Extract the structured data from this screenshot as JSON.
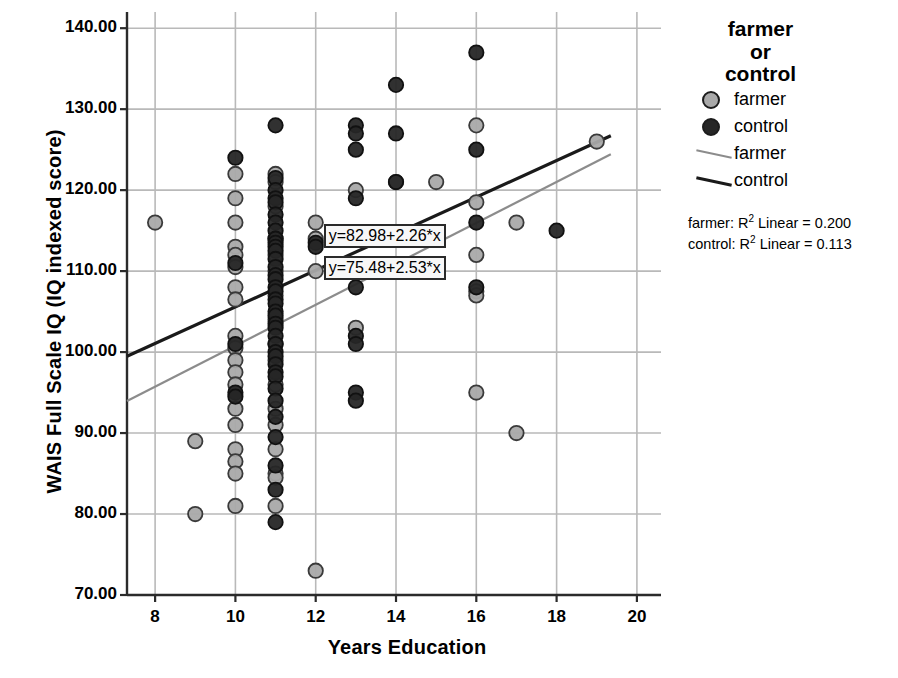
{
  "chart_data": {
    "type": "scatter",
    "title": "",
    "xlabel": "Years Education",
    "ylabel": "WAIS Full Scale IQ (IQ indexed score)",
    "xlim": [
      7.3,
      20.6
    ],
    "ylim": [
      70,
      142
    ],
    "xticks": [
      "8",
      "10",
      "12",
      "14",
      "16",
      "18",
      "20"
    ],
    "xtick_values": [
      8,
      10,
      12,
      14,
      16,
      18,
      20
    ],
    "yticks": [
      "70.00",
      "80.00",
      "90.00",
      "100.00",
      "110.00",
      "120.00",
      "130.00",
      "140.00"
    ],
    "ytick_values": [
      70,
      80,
      90,
      100,
      110,
      120,
      130,
      140
    ],
    "grid": true,
    "legend_position": "right",
    "series": [
      {
        "name": "farmer",
        "marker": "circle",
        "color": "#a9a9a9",
        "edge_color": "#3a3a3a",
        "points": [
          [
            8,
            116
          ],
          [
            9,
            89
          ],
          [
            9,
            80
          ],
          [
            10,
            122
          ],
          [
            10,
            119
          ],
          [
            10,
            116
          ],
          [
            10,
            113
          ],
          [
            10,
            112
          ],
          [
            10,
            110.5
          ],
          [
            10,
            108
          ],
          [
            10,
            106.5
          ],
          [
            10,
            102
          ],
          [
            10,
            100.5
          ],
          [
            10,
            99
          ],
          [
            10,
            97.5
          ],
          [
            10,
            96
          ],
          [
            10,
            93
          ],
          [
            10,
            91
          ],
          [
            10,
            88
          ],
          [
            10,
            86.5
          ],
          [
            10,
            85
          ],
          [
            10,
            81
          ],
          [
            11,
            122
          ],
          [
            11,
            121
          ],
          [
            11,
            118
          ],
          [
            11,
            114
          ],
          [
            11,
            112
          ],
          [
            11,
            110
          ],
          [
            11,
            107
          ],
          [
            11,
            104
          ],
          [
            11,
            101
          ],
          [
            11,
            99
          ],
          [
            11,
            96
          ],
          [
            11,
            93
          ],
          [
            11,
            91
          ],
          [
            11,
            88
          ],
          [
            11,
            85
          ],
          [
            11,
            84.5
          ],
          [
            11,
            81
          ],
          [
            12,
            116
          ],
          [
            12,
            114
          ],
          [
            12,
            110
          ],
          [
            12,
            73
          ],
          [
            13,
            120
          ],
          [
            13,
            103
          ],
          [
            14,
            121
          ],
          [
            15,
            121
          ],
          [
            16,
            128
          ],
          [
            16,
            118.5
          ],
          [
            16,
            112
          ],
          [
            16,
            107.5
          ],
          [
            16,
            107
          ],
          [
            16,
            95
          ],
          [
            17,
            116
          ],
          [
            17,
            90
          ],
          [
            19,
            126
          ]
        ]
      },
      {
        "name": "control",
        "marker": "circle",
        "color": "#262626",
        "edge_color": "#111111",
        "points": [
          [
            10,
            124
          ],
          [
            10,
            111
          ],
          [
            10,
            101
          ],
          [
            10,
            95
          ],
          [
            10,
            94.5
          ],
          [
            11,
            128
          ],
          [
            11,
            121.5
          ],
          [
            11,
            120
          ],
          [
            11,
            119
          ],
          [
            11,
            118.5
          ],
          [
            11,
            117
          ],
          [
            11,
            116
          ],
          [
            11,
            115
          ],
          [
            11,
            114
          ],
          [
            11,
            113.5
          ],
          [
            11,
            113
          ],
          [
            11,
            112.5
          ],
          [
            11,
            111.5
          ],
          [
            11,
            110.5
          ],
          [
            11,
            109.5
          ],
          [
            11,
            109
          ],
          [
            11,
            108
          ],
          [
            11,
            107.5
          ],
          [
            11,
            106.5
          ],
          [
            11,
            106
          ],
          [
            11,
            105
          ],
          [
            11,
            104.5
          ],
          [
            11,
            103.5
          ],
          [
            11,
            103
          ],
          [
            11,
            102
          ],
          [
            11,
            101
          ],
          [
            11,
            100
          ],
          [
            11,
            99.5
          ],
          [
            11,
            98.5
          ],
          [
            11,
            97.5
          ],
          [
            11,
            97
          ],
          [
            11,
            95.5
          ],
          [
            11,
            94
          ],
          [
            11,
            92
          ],
          [
            11,
            89.5
          ],
          [
            11,
            86
          ],
          [
            11,
            83
          ],
          [
            11,
            79
          ],
          [
            12,
            113.5
          ],
          [
            12,
            113
          ],
          [
            13,
            128
          ],
          [
            13,
            127
          ],
          [
            13,
            125
          ],
          [
            13,
            119
          ],
          [
            13,
            108
          ],
          [
            13,
            102
          ],
          [
            13,
            101
          ],
          [
            13,
            95
          ],
          [
            13,
            94
          ],
          [
            14,
            133
          ],
          [
            14,
            127
          ],
          [
            14,
            121
          ],
          [
            16,
            137
          ],
          [
            16,
            125
          ],
          [
            16,
            116
          ],
          [
            16,
            108
          ],
          [
            18,
            115
          ]
        ]
      }
    ],
    "fit_lines": [
      {
        "name": "farmer",
        "color": "#8c8c8c",
        "equation": "y=75.48+2.53*x",
        "intercept": 75.48,
        "slope": 2.53,
        "r2_label": "farmer: R2 Linear = 0.200",
        "r2": 0.2
      },
      {
        "name": "control",
        "color": "#1a1a1a",
        "equation": "y=82.98+2.26*x",
        "intercept": 82.98,
        "slope": 2.26,
        "r2_label": "control: R2 Linear = 0.113",
        "r2": 0.113
      }
    ],
    "annotations": [
      {
        "text": "y=82.98+2.26*x",
        "x": 12.25,
        "y": 114.2
      },
      {
        "text": "y=75.48+2.53*x",
        "x": 12.25,
        "y": 110.3
      }
    ]
  },
  "legend": {
    "title_line1": "farmer",
    "title_line2": "or",
    "title_line3": "control",
    "marker_farmer": "farmer",
    "marker_control": "control",
    "line_farmer": "farmer",
    "line_control": "control",
    "r2_farmer_prefix": "farmer: R",
    "r2_farmer_sup": "2",
    "r2_farmer_suffix": " Linear = 0.200",
    "r2_control_prefix": "control: R",
    "r2_control_sup": "2",
    "r2_control_suffix": " Linear = 0.113"
  },
  "axes": {
    "x_title": "Years Education",
    "y_title": "WAIS Full Scale IQ (IQ indexed score)"
  },
  "colors": {
    "farmer_marker": "#a9a9a9",
    "control_marker": "#262626",
    "farmer_line": "#8c8c8c",
    "control_line": "#1a1a1a",
    "grid": "#b9b9b9",
    "axis": "#2b2b2b"
  }
}
